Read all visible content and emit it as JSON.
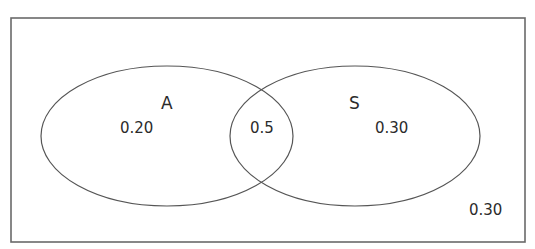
{
  "diagram": {
    "type": "venn",
    "universe": {
      "label": "0.30",
      "description": "outside both sets"
    },
    "sets": [
      {
        "name": "A",
        "only_value": "0.20"
      },
      {
        "name": "S",
        "only_value": "0.30"
      }
    ],
    "intersection": {
      "value": "0.5"
    },
    "colors": {
      "stroke": "#555555",
      "text": "#2b2b2b",
      "background": "#ffffff"
    }
  }
}
